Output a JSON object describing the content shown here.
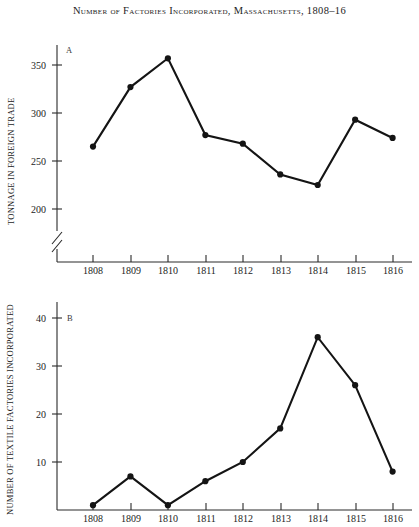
{
  "figure": {
    "title": "Number of Factories Incorporated, Massachusetts, 1808–16",
    "background": "#ffffff",
    "ink_color": "#141414"
  },
  "chart_data": [
    {
      "type": "line",
      "panel_label": "A",
      "title": "Number of Factories Incorporated, Massachusetts, 1808–16",
      "xlabel": "",
      "ylabel": "TONNAGE IN FOREIGN TRADE",
      "categories": [
        "1808",
        "1809",
        "1810",
        "1811",
        "1812",
        "1813",
        "1814",
        "1815",
        "1816"
      ],
      "x": [
        1808,
        1809,
        1810,
        1811,
        1812,
        1813,
        1814,
        1815,
        1816
      ],
      "values": [
        265,
        327,
        357,
        277,
        268,
        236,
        225,
        293,
        274
      ],
      "yticks": [
        200,
        250,
        300,
        350
      ],
      "ylim": [
        175,
        370
      ],
      "axis_break": true,
      "grid": false,
      "legend": "none",
      "markers": "filled-circle"
    },
    {
      "type": "line",
      "panel_label": "B",
      "title": "Number of Factories Incorporated, Massachusetts, 1808–16",
      "xlabel": "",
      "ylabel": "NUMBER OF TEXTILE FACTORIES INCORPORATED",
      "categories": [
        "1808",
        "1809",
        "1810",
        "1811",
        "1812",
        "1813",
        "1814",
        "1815",
        "1816"
      ],
      "x": [
        1808,
        1809,
        1810,
        1811,
        1812,
        1813,
        1814,
        1815,
        1816
      ],
      "values": [
        1,
        7,
        1,
        6,
        10,
        17,
        36,
        26,
        8
      ],
      "yticks": [
        10,
        20,
        30,
        40
      ],
      "ylim": [
        0,
        44
      ],
      "axis_break": false,
      "grid": false,
      "legend": "none",
      "markers": "filled-circle"
    }
  ]
}
